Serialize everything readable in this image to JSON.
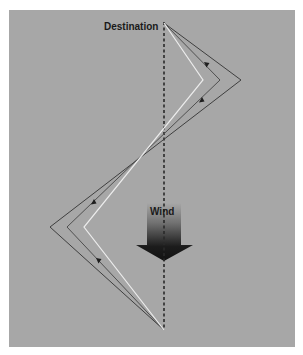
{
  "diagram": {
    "labels": {
      "destination": "Destination",
      "wind": "Wind"
    },
    "colors": {
      "background": "#a7a7a7",
      "outer_path": "#3f3f3f",
      "middle_path": "#505050",
      "inner_path": "#ececec",
      "axis": "#2a2a2a",
      "wind_arrow_top": "#a7a7a7",
      "wind_arrow_bottom": "#111111"
    },
    "points": {
      "start": [
        164,
        330
      ],
      "destination": [
        164,
        23
      ]
    },
    "paths": [
      {
        "name": "outer",
        "vertices": [
          [
            164,
            330
          ],
          [
            50,
            227
          ],
          [
            241,
            80
          ],
          [
            164,
            23
          ]
        ]
      },
      {
        "name": "middle",
        "vertices": [
          [
            164,
            330
          ],
          [
            67,
            227
          ],
          [
            220,
            80
          ],
          [
            164,
            23
          ]
        ]
      },
      {
        "name": "inner",
        "vertices": [
          [
            164,
            330
          ],
          [
            84,
            227
          ],
          [
            203,
            80
          ],
          [
            164,
            23
          ]
        ]
      }
    ],
    "direction_arrows": 4
  }
}
